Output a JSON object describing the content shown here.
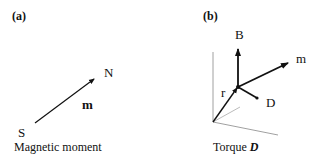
{
  "panels": [
    {
      "id": "a",
      "label": "(a)",
      "caption": "Magnetic moment",
      "vector_label": "m",
      "north_label": "N",
      "south_label": "S"
    },
    {
      "id": "b",
      "label": "(b)",
      "caption_prefix": "Torque",
      "caption_symbol": "D",
      "vectors": {
        "field": "B",
        "moment": "m",
        "position": "r",
        "torque": "D"
      }
    }
  ]
}
